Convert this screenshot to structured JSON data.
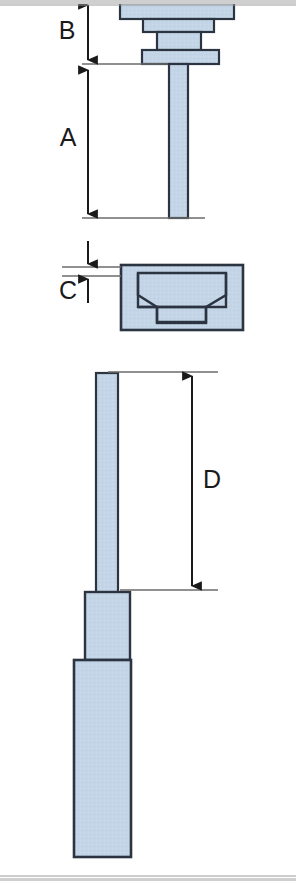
{
  "drawing": {
    "title": "Dimensioned product outline drawing",
    "background_color": "#ffffff",
    "part_fill_color": "#c3d5e6",
    "part_outline_color": "#2b3440",
    "dimension_line_color": "#1a1a1a",
    "extension_line_color": "#6b6b6b",
    "edge_band_color": "#cfcfcf",
    "views": [
      {
        "name": "top-assembly-view",
        "description": "Head with stacked flanges and long stem, dimensioned vertically by B and A"
      },
      {
        "name": "middle-seal-view",
        "description": "Rectangular block containing a trapezoidal cavity, dimensioned by C"
      },
      {
        "name": "bottom-probe-view",
        "description": "Slender rod stepping into a collar and then a wide body, dimensioned by D"
      }
    ],
    "dimensions": [
      {
        "id": "dim-b",
        "label": "B",
        "view": "top-assembly-view",
        "orientation": "vertical",
        "arrow_style": "double-ended"
      },
      {
        "id": "dim-a",
        "label": "A",
        "view": "top-assembly-view",
        "orientation": "vertical",
        "arrow_style": "double-ended"
      },
      {
        "id": "dim-c",
        "label": "C",
        "view": "middle-seal-view",
        "orientation": "vertical",
        "arrow_style": "outside-opposed"
      },
      {
        "id": "dim-d",
        "label": "D",
        "view": "bottom-probe-view",
        "orientation": "vertical",
        "arrow_style": "double-ended"
      }
    ]
  }
}
